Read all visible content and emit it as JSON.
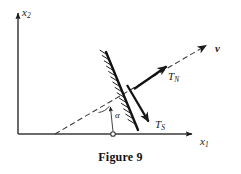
{
  "figure": {
    "caption": "Figure 9",
    "background_color": "#ffffff",
    "ink_color": "#1a1a1a",
    "width": 241,
    "height": 174
  },
  "axes": {
    "origin": {
      "x": 18,
      "y": 134
    },
    "vertical": {
      "label_base": "x",
      "label_sub": "2",
      "label_full": "x2",
      "tip": {
        "x": 18,
        "y": 10
      }
    },
    "horizontal": {
      "label_base": "x",
      "label_sub": "1",
      "label_full": "x1",
      "tip": {
        "x": 196,
        "y": 134
      }
    }
  },
  "vectors": [
    {
      "id": "velocity",
      "label_base": "v",
      "label_sub": "",
      "label_full": "v",
      "style": "dashed",
      "bold": true,
      "from": {
        "x": 55,
        "y": 134
      },
      "to": {
        "x": 212,
        "y": 42
      }
    },
    {
      "id": "normal-traction",
      "label_base": "T",
      "label_sub": "N",
      "label_full": "TN",
      "style": "solid-thick",
      "bold": false,
      "from": {
        "x": 134,
        "y": 89
      },
      "to": {
        "x": 173,
        "y": 62
      }
    },
    {
      "id": "shear-traction",
      "label_base": "T",
      "label_sub": "S",
      "label_full": "TS",
      "style": "solid-thick",
      "bold": false,
      "from": {
        "x": 127,
        "y": 85
      },
      "to": {
        "x": 153,
        "y": 129
      }
    }
  ],
  "surface": {
    "id": "hatched-barrier",
    "from": {
      "x": 106,
      "y": 52
    },
    "to": {
      "x": 138,
      "y": 130
    },
    "hatch_side": "upper-left",
    "hatch_count": 14
  },
  "angle": {
    "symbol": "α",
    "name": "alpha",
    "vertex": {
      "x": 113,
      "y": 134
    },
    "marker_top": {
      "x": 110,
      "y": 104
    }
  }
}
